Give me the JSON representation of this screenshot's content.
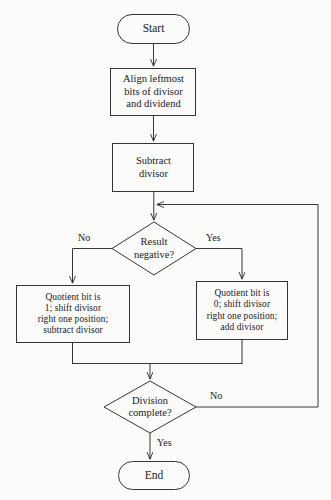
{
  "diagram": {
    "type": "flowchart",
    "colors": {
      "background": "#fbfbf9",
      "stroke": "#2b2b2b",
      "text": "#1a1a1a"
    },
    "nodes": {
      "start": {
        "id": "start",
        "shape": "terminal",
        "label": "Start"
      },
      "align": {
        "id": "align",
        "shape": "process",
        "label": "Align leftmost\nbits of divisor\nand dividend"
      },
      "subtract": {
        "id": "subtract",
        "shape": "process",
        "label": "Subtract\ndivisor"
      },
      "result_negative": {
        "id": "result_negative",
        "shape": "decision",
        "label": "Result\nnegative?"
      },
      "quotient_one": {
        "id": "quotient_one",
        "shape": "process",
        "label": "Quotient bit is\n1; shift divisor\nright one position;\nsubtract divisor"
      },
      "quotient_zero": {
        "id": "quotient_zero",
        "shape": "process",
        "label": "Quotient bit is\n0; shift divisor\nright one position;\nadd divisor"
      },
      "division_complete": {
        "id": "division_complete",
        "shape": "decision",
        "label": "Division\ncomplete?"
      },
      "end": {
        "id": "end",
        "shape": "terminal",
        "label": "End"
      }
    },
    "edge_labels": {
      "negative_no": "No",
      "negative_yes": "Yes",
      "complete_no": "No",
      "complete_yes": "Yes"
    }
  }
}
